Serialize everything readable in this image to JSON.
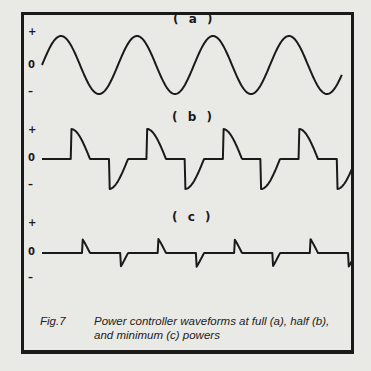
{
  "figure": {
    "number": "Fig.7",
    "caption_line1": "Power controller waveforms at full (a), half (b),",
    "caption_line2": "and minimum (c) powers",
    "ink_color": "#1a1a1a",
    "paper_color": "#e9e9e6"
  },
  "panels": [
    {
      "label": "( a )",
      "name": "full-power",
      "axis": {
        "plus": "+",
        "zero": "0",
        "minus": "–"
      },
      "conduction_fraction": 1.0,
      "cycles": 4
    },
    {
      "label": "( b )",
      "name": "half-power",
      "axis": {
        "plus": "+",
        "zero": "0",
        "minus": "–"
      },
      "conduction_fraction": 0.5,
      "cycles": 4
    },
    {
      "label": "( c )",
      "name": "minimum-power",
      "axis": {
        "plus": "+",
        "zero": "0",
        "minus": "–"
      },
      "conduction_fraction": 0.2,
      "cycles": 4
    }
  ]
}
